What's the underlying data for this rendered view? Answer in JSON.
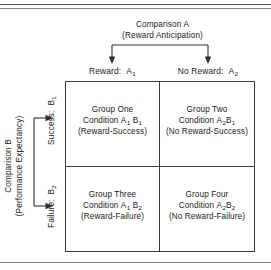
{
  "figure": {
    "type": "2x2-factorial-design-matrix",
    "rules": {
      "top_double_rule": true,
      "bottom_rule": true
    },
    "comparison_a": {
      "title": "Comparison A",
      "subtitle": "(Reward Anticipation)",
      "arrow_icon": "bracket-down-arrows-icon",
      "levels": [
        {
          "id": "A1",
          "label": "Reward:",
          "code_letter": "A",
          "code_sub": "1"
        },
        {
          "id": "A2",
          "label": "No Reward:",
          "code_letter": "A",
          "code_sub": "2"
        }
      ]
    },
    "comparison_b": {
      "title": "Comparison B",
      "subtitle": "(Performance Expectancy)",
      "arrow_icon": "bracket-right-arrows-icon",
      "levels": [
        {
          "id": "B1",
          "label": "Success:",
          "code_letter": "B",
          "code_sub": "1"
        },
        {
          "id": "B2",
          "label": "Failure:",
          "code_letter": "B",
          "code_sub": "2"
        }
      ]
    },
    "cells": [
      {
        "id": "A1B1",
        "group": "Group One",
        "condition_prefix": "Condition",
        "condition_a_letter": "A",
        "condition_a_sub": "1",
        "condition_b_letter": "B",
        "condition_b_sub": "1",
        "descriptor": "(Reward-Success)"
      },
      {
        "id": "A2B1",
        "group": "Group Two",
        "condition_prefix": "Condition",
        "condition_a_letter": "A",
        "condition_a_sub": "2",
        "condition_b_letter": "B",
        "condition_b_sub": "1",
        "descriptor": "(No Reward-Success)"
      },
      {
        "id": "A1B2",
        "group": "Group Three",
        "condition_prefix": "Condition",
        "condition_a_letter": "A",
        "condition_a_sub": "1",
        "condition_b_letter": "B",
        "condition_b_sub": "2",
        "descriptor": "(Reward-Failure)"
      },
      {
        "id": "A2B2",
        "group": "Group Four",
        "condition_prefix": "Condition",
        "condition_a_letter": "A",
        "condition_a_sub": "2",
        "condition_b_letter": "B",
        "condition_b_sub": "2",
        "descriptor": "(No Reward-Failure)"
      }
    ],
    "colors": {
      "ink": "#1a1a1a",
      "border": "#3d3d3d",
      "rule": "#6f6f6f",
      "background": "#ffffff"
    }
  }
}
